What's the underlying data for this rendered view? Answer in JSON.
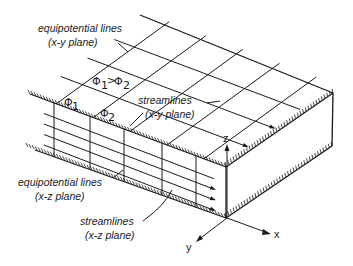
{
  "diagram": {
    "type": "flow-net-3d-block",
    "labels": {
      "equipotential_xy": [
        "equipotential lines",
        "(x-y plane)"
      ],
      "streamlines_xy": [
        "streamlines",
        "(x-y plane)"
      ],
      "equipotential_xz": [
        "equipotential lines",
        "(x-z plane)"
      ],
      "streamlines_xz": [
        "streamlines",
        "(x-z plane)"
      ]
    },
    "symbols": {
      "phi1": "Φ",
      "phi1_sub": "1",
      "phi2": "Φ",
      "phi2_sub": "2",
      "relation": "Φ₁ > Φ₂"
    },
    "axes": {
      "x": "x",
      "y": "y",
      "z": "z"
    },
    "colors": {
      "ink": "#1a1a1a",
      "background": "#ffffff"
    }
  }
}
